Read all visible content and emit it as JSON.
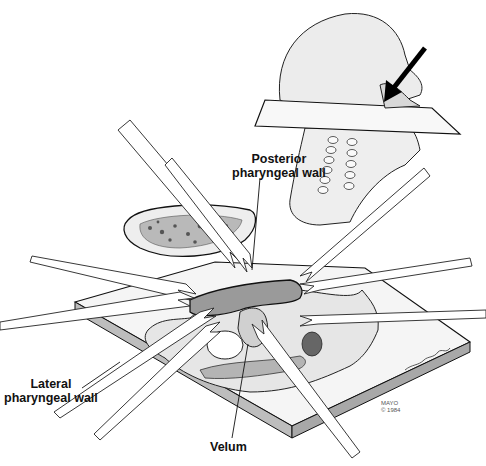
{
  "figure": {
    "type": "medical-illustration",
    "labels": {
      "posterior": [
        "Posterior",
        "pharyngeal wall"
      ],
      "lateral": [
        "Lateral",
        "pharyngeal wall"
      ],
      "velum": "Velum"
    },
    "credit": {
      "line1": "MAYO",
      "line2": "© 1984"
    },
    "colors": {
      "ink": "#111111",
      "tissue": "#c8c8c8",
      "tissue_dark": "#8a8a8a",
      "block_side": "#b0b0b0",
      "background": "#ffffff"
    }
  }
}
